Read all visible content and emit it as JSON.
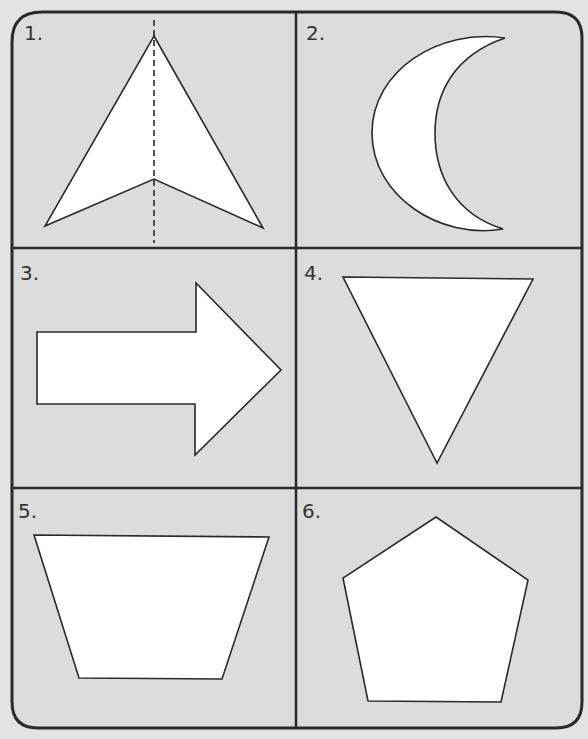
{
  "worksheet": {
    "background_color": "#e3e3e3",
    "shape_fill": "#ffffff",
    "line_color": "#2a2a2a",
    "cells": [
      {
        "label": "1.",
        "shape": "arrowhead-kite",
        "has_symmetry_line": true
      },
      {
        "label": "2.",
        "shape": "crescent-moon",
        "has_symmetry_line": false
      },
      {
        "label": "3.",
        "shape": "right-arrow",
        "has_symmetry_line": false
      },
      {
        "label": "4.",
        "shape": "inverted-triangle",
        "has_symmetry_line": false
      },
      {
        "label": "5.",
        "shape": "trapezoid",
        "has_symmetry_line": false
      },
      {
        "label": "6.",
        "shape": "pentagon",
        "has_symmetry_line": false
      }
    ]
  }
}
